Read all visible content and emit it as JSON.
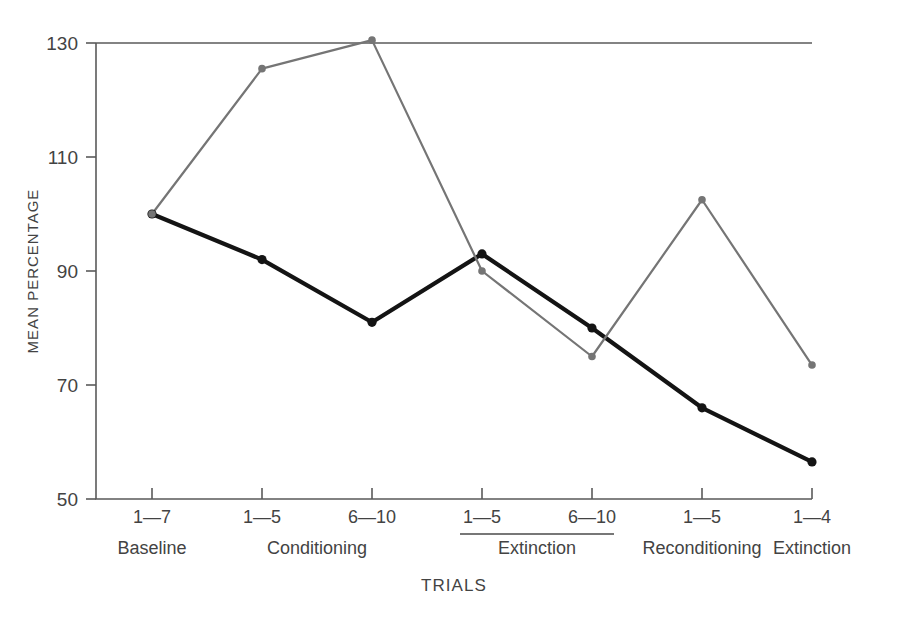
{
  "chart_data": {
    "type": "line",
    "title": "",
    "xlabel": "TRIALS",
    "ylabel": "MEAN PERCENTAGE",
    "ylim": [
      50,
      130
    ],
    "yticks": [
      50,
      70,
      90,
      110,
      130
    ],
    "grid": false,
    "legend": "none",
    "x": [
      "1-7",
      "1-5",
      "6-10",
      "1-5",
      "6-10",
      "1-5",
      "1-4"
    ],
    "xtick_labels": [
      "1—7",
      "1—5",
      "6—10",
      "1—5",
      "6—10",
      "1—5",
      "1—4"
    ],
    "phase_groups": [
      {
        "label": "Baseline",
        "ticks": [
          0
        ],
        "ruled": false
      },
      {
        "label": "Conditioning",
        "ticks": [
          1,
          2
        ],
        "ruled": false
      },
      {
        "label": "Extinction",
        "ticks": [
          3,
          4
        ],
        "ruled": true
      },
      {
        "label": "Reconditioning",
        "ticks": [
          5
        ],
        "ruled": false
      },
      {
        "label": "Extinction",
        "ticks": [
          6
        ],
        "ruled": false
      }
    ],
    "series": [
      {
        "name": "black-series",
        "color": "#141414",
        "values": [
          100.0,
          92.0,
          81.0,
          93.0,
          80.0,
          66.0,
          56.5
        ]
      },
      {
        "name": "gray-series",
        "color": "#757575",
        "values": [
          100.0,
          125.5,
          130.5,
          90.0,
          75.0,
          102.5,
          73.5
        ]
      }
    ]
  }
}
